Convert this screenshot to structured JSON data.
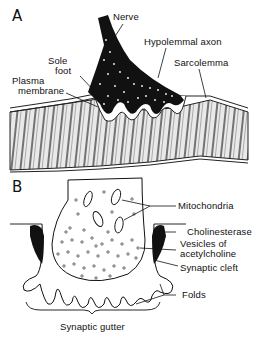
{
  "figure": {
    "panel_a": {
      "letter": "A",
      "labels": {
        "nerve": "Nerve",
        "hypolemmal_axon": "Hypolemmal axon",
        "sole_foot_1": "Sole",
        "sole_foot_2": "foot",
        "plasma_membrane_1": "Plasma",
        "plasma_membrane_2": "membrane",
        "sarcolemma": "Sarcolemma"
      }
    },
    "panel_b": {
      "letter": "B",
      "labels": {
        "mitochondria": "Mitochondria",
        "cholinesterase": "Cholinesterase",
        "vesicles_1": "Vesicles  of",
        "vesicles_2": "acetylcholine",
        "synaptic_cleft": "Synaptic  cleft",
        "folds": "Folds",
        "synaptic_gutter": "Synaptic  gutter"
      }
    }
  }
}
